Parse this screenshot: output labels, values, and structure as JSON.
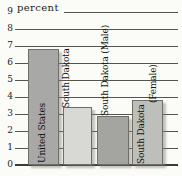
{
  "chart_data": {
    "type": "bar",
    "title": "",
    "ylabel": "percent",
    "xlabel": "",
    "categories": [
      "United States",
      "South Dakota",
      "South Dakota (Male)",
      "South Dakota (Female)"
    ],
    "values": [
      6.8,
      3.4,
      2.9,
      3.8
    ],
    "ylim": [
      0,
      9
    ],
    "ytick_step": 1,
    "yticks": [
      0,
      1,
      2,
      3,
      4,
      5,
      6,
      7,
      8,
      9
    ],
    "grid": true,
    "legend": false,
    "bar_label_orientation": "vertical-bottom-to-top",
    "bars": [
      {
        "label": "United States",
        "value": 6.8,
        "color": "#a8a8a6",
        "label_lines": [
          "United States"
        ]
      },
      {
        "label": "South Dakota",
        "value": 3.4,
        "color": "#d8d8d4",
        "label_lines": [
          "South Dakota"
        ]
      },
      {
        "label": "South Dakota (Male)",
        "value": 2.9,
        "color": "#a4a4a0",
        "label_lines": [
          "South Dakota (Male)"
        ]
      },
      {
        "label": "South Dakota (Female)",
        "value": 3.8,
        "color": "#bebeba",
        "label_lines": [
          "South Dakota",
          "(Female)"
        ]
      }
    ],
    "colors": {
      "gridline": "#555550",
      "axis_baseline": "#3a3a36",
      "text": "#1c1c1a",
      "background": "#fbfbf7"
    }
  }
}
